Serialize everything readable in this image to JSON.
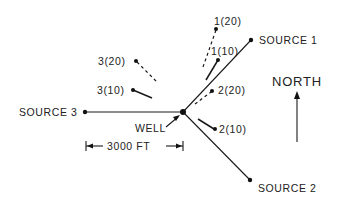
{
  "diagram": {
    "well": {
      "label": "WELL",
      "x": 183,
      "y": 112
    },
    "sources": [
      {
        "id": "source-1",
        "label": "SOURCE 1",
        "x": 251,
        "y": 40
      },
      {
        "id": "source-2",
        "label": "SOURCE 2",
        "x": 250,
        "y": 180
      },
      {
        "id": "source-3",
        "label": "SOURCE 3",
        "x": 85,
        "y": 112
      }
    ],
    "points": [
      {
        "id": "p-1-20",
        "label": "1(20)",
        "style": "dashed"
      },
      {
        "id": "p-1-10",
        "label": "1(10)",
        "style": "solid"
      },
      {
        "id": "p-2-20",
        "label": "2(20)",
        "style": "dashed"
      },
      {
        "id": "p-2-10",
        "label": "2(10)",
        "style": "solid"
      },
      {
        "id": "p-3-20",
        "label": "3(20)",
        "style": "dashed"
      },
      {
        "id": "p-3-10",
        "label": "3(10)",
        "style": "solid"
      }
    ],
    "scale_bar": {
      "label": "3000 FT"
    },
    "north": {
      "label": "NORTH"
    }
  }
}
